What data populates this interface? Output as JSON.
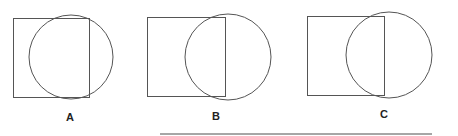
{
  "figures": [
    {
      "label": "A",
      "square": {
        "x": 13,
        "y": 18,
        "w": 76,
        "h": 79
      },
      "circle": {
        "cx": 71,
        "cy": 57,
        "r": 42
      },
      "label_pos": {
        "x": 66,
        "y": 121
      }
    },
    {
      "label": "B",
      "square": {
        "x": 147,
        "y": 17,
        "w": 78,
        "h": 79
      },
      "circle": {
        "cx": 228,
        "cy": 57,
        "r": 43
      },
      "label_pos": {
        "x": 212,
        "y": 120
      }
    },
    {
      "label": "C",
      "square": {
        "x": 307,
        "y": 16,
        "w": 77,
        "h": 79
      },
      "circle": {
        "cx": 389,
        "cy": 55,
        "r": 43
      },
      "label_pos": {
        "x": 380,
        "y": 118
      }
    }
  ],
  "rule": {
    "x1": 160,
    "x2": 432,
    "y": 134
  },
  "colors": {
    "stroke": "#555555",
    "text": "#222222"
  }
}
